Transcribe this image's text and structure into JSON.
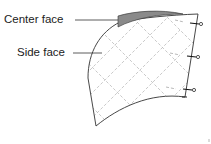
{
  "labels": {
    "center_face": "Center face",
    "side_face": "Side face"
  },
  "colors": {
    "outline": "#333333",
    "center_face_fill": "#8a8a8a",
    "grid_dashes": "#bbbbbb",
    "pin": "#111111"
  },
  "pins": [
    {
      "name": "pin-top"
    },
    {
      "name": "pin-middle"
    },
    {
      "name": "pin-bottom"
    }
  ]
}
